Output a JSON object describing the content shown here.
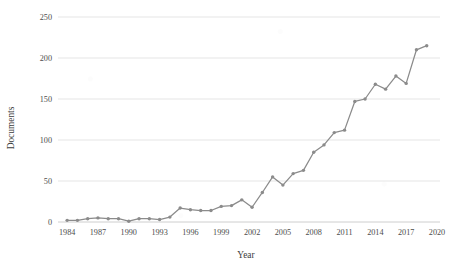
{
  "chart_data": {
    "type": "line",
    "title": "",
    "xlabel": "Year",
    "ylabel": "Documents",
    "xlim": [
      1983.5,
      2020.0
    ],
    "ylim": [
      0,
      250
    ],
    "grid": true,
    "legend": false,
    "series_color": "#8b8b8b",
    "marker": "circle",
    "x": [
      1984,
      1985,
      1986,
      1987,
      1988,
      1989,
      1990,
      1991,
      1992,
      1993,
      1994,
      1995,
      1996,
      1997,
      1998,
      1999,
      2000,
      2001,
      2002,
      2003,
      2004,
      2005,
      2006,
      2007,
      2008,
      2009,
      2010,
      2011,
      2012,
      2013,
      2014,
      2015,
      2016,
      2017,
      2018,
      2019
    ],
    "values": [
      2,
      2,
      4,
      5,
      4,
      4,
      1,
      4,
      4,
      3,
      6,
      17,
      15,
      14,
      14,
      19,
      20,
      27,
      18,
      36,
      55,
      45,
      59,
      63,
      85,
      94,
      109,
      112,
      147,
      150,
      168,
      162,
      178,
      169,
      210,
      215
    ],
    "series": [
      {
        "name": "Documents",
        "values": [
          2,
          2,
          4,
          5,
          4,
          4,
          1,
          4,
          4,
          3,
          6,
          17,
          15,
          14,
          14,
          19,
          20,
          27,
          18,
          36,
          55,
          45,
          59,
          63,
          85,
          94,
          109,
          112,
          147,
          150,
          168,
          162,
          178,
          169,
          210,
          215
        ]
      }
    ],
    "xticks": [
      1984,
      1987,
      1990,
      1993,
      1996,
      1999,
      2002,
      2005,
      2008,
      2011,
      2014,
      2017,
      2020
    ],
    "xticklabels": [
      "1984",
      "1987",
      "1990",
      "1993",
      "1996",
      "1999",
      "2002",
      "2005",
      "2008",
      "2011",
      "2014",
      "2017",
      "2020"
    ],
    "yticks": [
      0,
      50,
      100,
      150,
      200,
      250
    ],
    "yticklabels": [
      "0",
      "50",
      "100",
      "150",
      "200",
      "250"
    ]
  },
  "axes": {
    "y_label": "Documents",
    "x_label": "Year"
  }
}
